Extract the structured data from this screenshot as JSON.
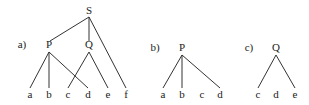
{
  "diagrams": [
    {
      "label": "a)",
      "label_pos": [
        22,
        48
      ],
      "nodes": [
        {
          "id": "S",
          "text": "S",
          "x": 89,
          "y": 14
        },
        {
          "id": "P",
          "text": "P",
          "x": 49,
          "y": 48
        },
        {
          "id": "Q",
          "text": "Q",
          "x": 89,
          "y": 48
        },
        {
          "id": "a",
          "text": "a",
          "x": 30,
          "y": 98
        },
        {
          "id": "b",
          "text": "b",
          "x": 49,
          "y": 98
        },
        {
          "id": "c",
          "text": "c",
          "x": 68,
          "y": 98
        },
        {
          "id": "d",
          "text": "d",
          "x": 88,
          "y": 98
        },
        {
          "id": "e",
          "text": "e",
          "x": 108,
          "y": 98
        },
        {
          "id": "f",
          "text": "f",
          "x": 126,
          "y": 98
        }
      ],
      "edges": [
        [
          89,
          17,
          50,
          41
        ],
        [
          89,
          17,
          89,
          41
        ],
        [
          89,
          17,
          126,
          88
        ],
        [
          49,
          52,
          30,
          88
        ],
        [
          49,
          52,
          49,
          88
        ],
        [
          49,
          52,
          88,
          88
        ],
        [
          89,
          52,
          68,
          88
        ],
        [
          89,
          52,
          108,
          88
        ]
      ]
    },
    {
      "label": "b)",
      "label_pos": [
        155,
        51
      ],
      "nodes": [
        {
          "id": "P",
          "text": "P",
          "x": 182,
          "y": 51
        },
        {
          "id": "a",
          "text": "a",
          "x": 163,
          "y": 98
        },
        {
          "id": "b",
          "text": "b",
          "x": 182,
          "y": 98
        },
        {
          "id": "c",
          "text": "c",
          "x": 202,
          "y": 98
        },
        {
          "id": "d",
          "text": "d",
          "x": 220,
          "y": 98
        }
      ],
      "edges": [
        [
          182,
          55,
          163,
          88
        ],
        [
          182,
          55,
          182,
          88
        ],
        [
          182,
          55,
          220,
          88
        ]
      ]
    },
    {
      "label": "c)",
      "label_pos": [
        249,
        51
      ],
      "nodes": [
        {
          "id": "Q",
          "text": "Q",
          "x": 276,
          "y": 51
        },
        {
          "id": "c",
          "text": "c",
          "x": 258,
          "y": 98
        },
        {
          "id": "d",
          "text": "d",
          "x": 276,
          "y": 98
        },
        {
          "id": "e",
          "text": "e",
          "x": 295,
          "y": 98
        }
      ],
      "edges": [
        [
          276,
          55,
          258,
          88
        ],
        [
          276,
          55,
          295,
          88
        ]
      ]
    }
  ]
}
